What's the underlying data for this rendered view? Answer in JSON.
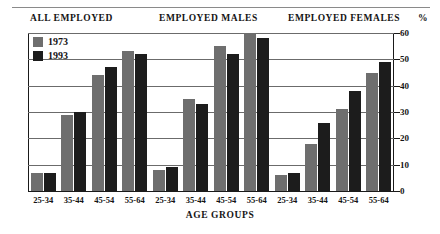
{
  "chart_data": {
    "type": "bar",
    "title": "",
    "xlabel": "AGE GROUPS",
    "ylabel": "%",
    "ylim": [
      0,
      60
    ],
    "yticks": [
      0,
      10,
      20,
      30,
      40,
      50,
      60
    ],
    "ytick_labels": [
      "0",
      "10",
      "20",
      "30",
      "40",
      "50",
      "60"
    ],
    "grid": true,
    "legend_position": "top-left-inside",
    "panel_titles": [
      "ALL EMPLOYED",
      "EMPLOYED MALES",
      "EMPLOYED FEMALES"
    ],
    "categories": [
      "25-34",
      "35-44",
      "45-54",
      "55-64"
    ],
    "series": [
      {
        "name": "1973",
        "color": "#6e6e6e"
      },
      {
        "name": "1993",
        "color": "#1c1c1c"
      }
    ],
    "panels": [
      {
        "title": "ALL EMPLOYED",
        "categories": [
          "25-34",
          "35-44",
          "45-54",
          "55-64"
        ],
        "series": [
          {
            "name": "1973",
            "values": [
              7,
              29,
              44,
              53
            ]
          },
          {
            "name": "1993",
            "values": [
              7,
              30,
              47,
              52
            ]
          }
        ]
      },
      {
        "title": "EMPLOYED MALES",
        "categories": [
          "25-34",
          "35-44",
          "45-54",
          "55-64"
        ],
        "series": [
          {
            "name": "1973",
            "values": [
              8,
              35,
              55,
              60
            ]
          },
          {
            "name": "1993",
            "values": [
              9,
              33,
              52,
              58
            ]
          }
        ]
      },
      {
        "title": "EMPLOYED FEMALES",
        "categories": [
          "25-34",
          "35-44",
          "45-54",
          "55-64"
        ],
        "series": [
          {
            "name": "1973",
            "values": [
              6,
              18,
              31,
              45
            ]
          },
          {
            "name": "1993",
            "values": [
              7,
              26,
              38,
              49
            ]
          }
        ]
      }
    ]
  },
  "legend": {
    "items": [
      {
        "label": "1973",
        "color": "#6e6e6e"
      },
      {
        "label": "1993",
        "color": "#1c1c1c"
      }
    ]
  },
  "axis": {
    "percent_symbol": "%",
    "x_title": "AGE GROUPS"
  }
}
